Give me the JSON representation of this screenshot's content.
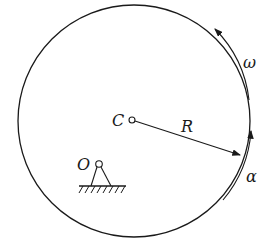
{
  "diagram": {
    "type": "mechanics",
    "labels": {
      "center": "C",
      "pivot": "O",
      "radius": "R",
      "angular_velocity": "ω",
      "angular_acceleration": "α"
    },
    "colors": {
      "stroke": "#1a1a1a",
      "background": "#ffffff"
    }
  }
}
